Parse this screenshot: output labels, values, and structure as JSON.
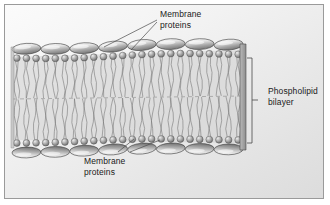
{
  "figure": {
    "background_color": "#eeeeee",
    "frame_color": "#9a9a9a"
  },
  "labels": {
    "top": {
      "line1": "Membrane",
      "line2": "proteins"
    },
    "bottom": {
      "line1": "Membrane",
      "line2": "proteins"
    },
    "right": {
      "line1": "Phospholipid",
      "line2": "bilayer"
    }
  },
  "diagram": {
    "colors": {
      "protein_fill_light": "#f0f0f0",
      "protein_fill_dark": "#8d8d8d",
      "head_fill_light": "#d8d8d8",
      "head_fill_dark": "#6e6e6e",
      "tail_stroke": "#6a6a6a",
      "outline": "#3a3a3a",
      "leader_line": "#4a4a4a",
      "bracket": "#4a4a4a"
    },
    "counts": {
      "top_proteins": 8,
      "bottom_proteins": 8,
      "phospholipids_per_leaflet": 24,
      "tails_per_phospholipid": 2
    },
    "membrane": {
      "left_x": 12,
      "right_x": 243,
      "top_y": 42,
      "bottom_y": 152,
      "midline_style": "dashed"
    },
    "bracket": {
      "x": 252,
      "top_y": 58,
      "bottom_y": 143
    }
  },
  "chart_data": {
    "type": "diagram",
    "title": "Phospholipid bilayer",
    "elements": [
      {
        "name": "membrane proteins (outer leaflet)",
        "count": 8,
        "shape": "ellipse"
      },
      {
        "name": "phospholipid heads (outer leaflet)",
        "count": 24,
        "shape": "sphere"
      },
      {
        "name": "phospholipid tails (outer leaflet)",
        "count": 48,
        "shape": "wavy-line"
      },
      {
        "name": "phospholipid tails (inner leaflet)",
        "count": 48,
        "shape": "wavy-line"
      },
      {
        "name": "phospholipid heads (inner leaflet)",
        "count": 24,
        "shape": "sphere"
      },
      {
        "name": "membrane proteins (inner leaflet)",
        "count": 8,
        "shape": "ellipse"
      }
    ],
    "annotations": [
      "Membrane proteins",
      "Membrane proteins",
      "Phospholipid bilayer"
    ]
  }
}
